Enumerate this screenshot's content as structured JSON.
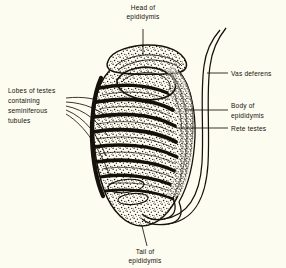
{
  "figure": {
    "type": "anatomical-line-drawing",
    "style": "black ink stipple engraving on cream paper",
    "background_color": "#fdfcf0",
    "ink_color": "#15120c"
  },
  "labels": {
    "head": {
      "name": "head-of-epididymis",
      "lines": [
        "Head of",
        "epididymis"
      ],
      "line1": "Head of",
      "line2": "epididymis",
      "position": "top-center",
      "leader": "vertical line down to the cap at the top of the testis"
    },
    "lobes": {
      "name": "lobes-of-testes",
      "lines": [
        "Lobes of testes",
        "containing",
        "seminiferous",
        "tubules"
      ],
      "line1": "Lobes of testes",
      "line2": "containing",
      "line3": "seminiferous",
      "line4": "tubules",
      "position": "left",
      "leader": "five leader lines fanning right into separate lobules"
    },
    "vas": {
      "name": "vas-deferens",
      "lines": [
        "Vas deferens"
      ],
      "line1": "Vas deferens",
      "position": "right-upper",
      "leader": "short horizontal line to the paired ascending duct"
    },
    "body": {
      "name": "body-of-epididymis",
      "lines": [
        "Body of",
        "epididymis"
      ],
      "line1": "Body of",
      "line2": "epididymis",
      "position": "right-middle",
      "leader": "horizontal line to the duct along the right border of the testis"
    },
    "rete": {
      "name": "rete-testes",
      "lines": [
        "Rete testes"
      ],
      "line1": "Rete testes",
      "position": "right-middle-lower",
      "leader": "horizontal line into the mediastinum of the testis"
    },
    "tail": {
      "name": "tail-of-epididymis",
      "lines": [
        "Tail of",
        "epididymis"
      ],
      "line1": "Tail of",
      "line2": "epididymis",
      "position": "bottom-center",
      "leader": "short slanted line up to the lower pole of the testis"
    }
  },
  "structures": {
    "testis": "large ovoid body, stippled parenchyma crossed by dark septa",
    "lobules_count": 8,
    "epididymis_head": "crescent cap straddling the upper pole",
    "epididymis_body": "duct descending along the posterior (right) border",
    "epididymis_tail": "duct looping under the lower pole",
    "vas_deferens": "paired parallel lines ascending to the upper right corner"
  }
}
